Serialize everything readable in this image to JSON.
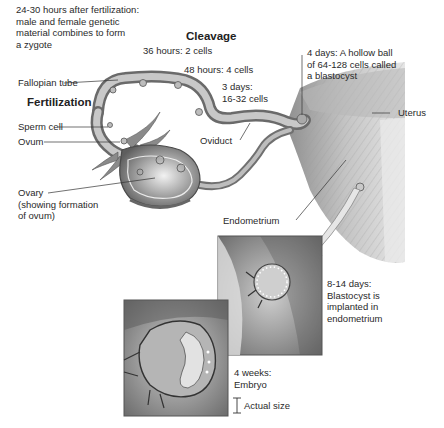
{
  "diagram": {
    "topic": "Fertilization, cleavage and implantation",
    "headings": {
      "cleavage": "Cleavage",
      "fertilization": "Fertilization"
    },
    "notes": {
      "zygote": [
        "24-30 hours after fertilization:",
        "male and female genetic",
        "material combines to form",
        "a zygote"
      ],
      "hours36": "36 hours: 2 cells",
      "hours48": "48 hours: 4 cells",
      "days3": [
        "3 days:",
        "16-32 cells"
      ],
      "days4": [
        "4 days: A hollow ball",
        "of 64-128 cells called",
        "a blastocyst"
      ],
      "days8_14": [
        "8-14 days:",
        "Blastocyst is",
        "implanted in",
        "endometrium"
      ],
      "weeks4": [
        "4 weeks:",
        "Embryo"
      ],
      "actual_size": "Actual size"
    },
    "labels": {
      "fallopian_tube": "Fallopian tube",
      "sperm_cell": "Sperm cell",
      "ovum": "Ovum",
      "ovary": [
        "Ovary",
        "(showing formation",
        "of ovum)"
      ],
      "oviduct": "Oviduct",
      "uterus": "Uterus",
      "endometrium": "Endometrium"
    },
    "colors": {
      "line": "#333333",
      "tissue_dark": "#6e6e6e",
      "tissue_mid": "#a8a8a8",
      "tissue_light": "#d8d8d8"
    }
  }
}
